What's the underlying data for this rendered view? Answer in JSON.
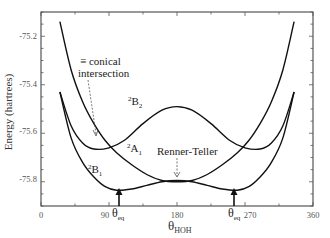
{
  "chart_data": {
    "type": "line",
    "title": "",
    "xlabel": "θ_HOH",
    "xlabel_main": "θ",
    "xlabel_sub": "HOH",
    "ylabel": "Energy (hartrees)",
    "xlim": [
      0,
      360
    ],
    "ylim": [
      -75.9,
      -75.1
    ],
    "x_ticks": [
      "0",
      "90",
      "180",
      "270",
      "360"
    ],
    "y_ticks": [
      "-75.2",
      "-75.4",
      "-75.6",
      "-75.8"
    ],
    "grid": false,
    "series": [
      {
        "name": "2B2",
        "label_sup": "2",
        "label_main": "B",
        "label_sub": "2",
        "x": [
          25,
          40,
          55,
          70,
          90,
          110,
          135,
          160,
          180,
          200,
          225,
          250,
          270,
          290,
          305,
          320,
          335
        ],
        "values": [
          -75.43,
          -75.57,
          -75.64,
          -75.665,
          -75.66,
          -75.63,
          -75.56,
          -75.505,
          -75.49,
          -75.505,
          -75.56,
          -75.63,
          -75.66,
          -75.665,
          -75.64,
          -75.57,
          -75.43
        ]
      },
      {
        "name": "2A1",
        "label_sup": "2",
        "label_main": "A",
        "label_sub": "1",
        "x": [
          25,
          40,
          55,
          70,
          85,
          100,
          120,
          140,
          160,
          180,
          200,
          220,
          240,
          260,
          275,
          290,
          305,
          320,
          335
        ],
        "values": [
          -75.14,
          -75.34,
          -75.47,
          -75.56,
          -75.63,
          -75.68,
          -75.73,
          -75.77,
          -75.795,
          -75.8,
          -75.795,
          -75.77,
          -75.73,
          -75.68,
          -75.63,
          -75.56,
          -75.47,
          -75.34,
          -75.14
        ]
      },
      {
        "name": "2B1",
        "label_sup": "2",
        "label_main": "B",
        "label_sub": "1",
        "x": [
          25,
          40,
          55,
          70,
          85,
          100,
          120,
          140,
          160,
          180,
          200,
          220,
          240,
          260,
          275,
          290,
          305,
          320,
          335
        ],
        "values": [
          -75.43,
          -75.62,
          -75.72,
          -75.78,
          -75.82,
          -75.835,
          -75.83,
          -75.815,
          -75.8,
          -75.795,
          -75.8,
          -75.815,
          -75.83,
          -75.835,
          -75.82,
          -75.78,
          -75.72,
          -75.62,
          -75.43
        ]
      }
    ],
    "annotations": [
      {
        "text": "≡ conical intersection",
        "line1": "≡ conical",
        "line2": "intersection",
        "points_to": {
          "x": 66,
          "y": -75.65
        },
        "style": "dashed-arrow"
      },
      {
        "text": "Renner-Teller",
        "points_to": {
          "x": 180,
          "y": -75.8
        },
        "style": "dashed-arrow"
      },
      {
        "text": "θ_eq",
        "main": "θ",
        "sub": "eq",
        "points_to": {
          "x": 104,
          "y": -75.835
        },
        "style": "solid-arrow"
      },
      {
        "text": "θ_eq",
        "main": "θ",
        "sub": "eq",
        "points_to": {
          "x": 256,
          "y": -75.835
        },
        "style": "solid-arrow"
      }
    ]
  }
}
